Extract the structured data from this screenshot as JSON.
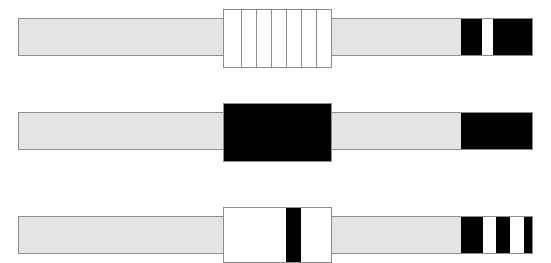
{
  "figure": {
    "background_color": "#ffffff",
    "width": 551,
    "height": 263,
    "palette": {
      "rail_fill": "#e4e4e4",
      "outline": "#8d8d8d",
      "marker_black": "#000000",
      "marker_white": "#ffffff"
    }
  },
  "bars": [
    {
      "id": "bar-1",
      "label": "Strip 1 — segmented centre block, two black end bands",
      "rail": {
        "x": 18,
        "y": 18,
        "width": 515,
        "height": 38
      },
      "center_block": {
        "x": 223,
        "y": 9,
        "width": 109,
        "height": 59,
        "fill": "#ffffff",
        "style": "segmented",
        "segment_count": 7,
        "divider_offsets": [
          17,
          32,
          47,
          62,
          77,
          92
        ]
      },
      "end_bands": [
        {
          "x": 461,
          "y": 18,
          "width": 21,
          "height": 38,
          "fill": "#000000",
          "name": "band-black-1"
        },
        {
          "x": 482,
          "y": 18,
          "width": 11,
          "height": 38,
          "fill": "#ffffff",
          "name": "band-white-1"
        },
        {
          "x": 493,
          "y": 18,
          "width": 40,
          "height": 38,
          "fill": "#000000",
          "name": "band-black-2"
        }
      ]
    },
    {
      "id": "bar-2",
      "label": "Strip 2 — solid black centre block, single black end band",
      "rail": {
        "x": 18,
        "y": 112,
        "width": 515,
        "height": 38
      },
      "center_block": {
        "x": 223,
        "y": 103,
        "width": 109,
        "height": 59,
        "fill": "#000000",
        "style": "solid",
        "segment_count": 1,
        "divider_offsets": []
      },
      "end_bands": [
        {
          "x": 461,
          "y": 112,
          "width": 72,
          "height": 38,
          "fill": "#000000",
          "name": "band-black-1"
        }
      ]
    },
    {
      "id": "bar-3",
      "label": "Strip 3 — white centre block with black stripe, striped end bands",
      "rail": {
        "x": 18,
        "y": 216,
        "width": 515,
        "height": 38
      },
      "center_block": {
        "x": 223,
        "y": 207,
        "width": 109,
        "height": 56,
        "fill": "#ffffff",
        "style": "striped",
        "segment_count": 1,
        "divider_offsets": [],
        "stripes": [
          {
            "offset": 62,
            "width": 15,
            "fill": "#000000",
            "name": "centre-stripe-black"
          }
        ]
      },
      "end_bands": [
        {
          "x": 461,
          "y": 216,
          "width": 22,
          "height": 38,
          "fill": "#000000",
          "name": "band-black-1"
        },
        {
          "x": 483,
          "y": 216,
          "width": 13,
          "height": 38,
          "fill": "#ffffff",
          "name": "band-white-1"
        },
        {
          "x": 496,
          "y": 216,
          "width": 14,
          "height": 38,
          "fill": "#000000",
          "name": "band-black-2"
        },
        {
          "x": 510,
          "y": 216,
          "width": 14,
          "height": 38,
          "fill": "#ffffff",
          "name": "band-white-2"
        },
        {
          "x": 524,
          "y": 216,
          "width": 9,
          "height": 38,
          "fill": "#000000",
          "name": "band-black-3"
        }
      ]
    }
  ]
}
